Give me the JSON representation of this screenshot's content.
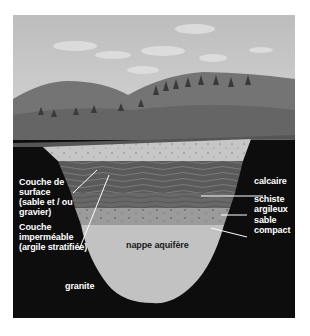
{
  "diagram": {
    "title": "",
    "colors": {
      "sky": "#c9c9c9",
      "hills": "#6f6f6f",
      "granite": "#0d0d0d",
      "surface_sand": "#c6c6c6",
      "limestone": "#5e5e5e",
      "shale": "#6c6c6c",
      "compact_sand": "#999999",
      "aquifer": "#c2c2c2",
      "label_text": "#ffffff"
    },
    "labels": {
      "surface_layer": "Couche de\nsurface\n(sable et / ou\ngravier)",
      "impermeable_layer": "Couche\nimperméable\n(argile stratifiée)",
      "limestone": "calcaire",
      "shale": "schiste\nargileux",
      "compact_sand": "sable\ncompact",
      "aquifer": "nappe aquifère",
      "granite": "granite"
    }
  }
}
